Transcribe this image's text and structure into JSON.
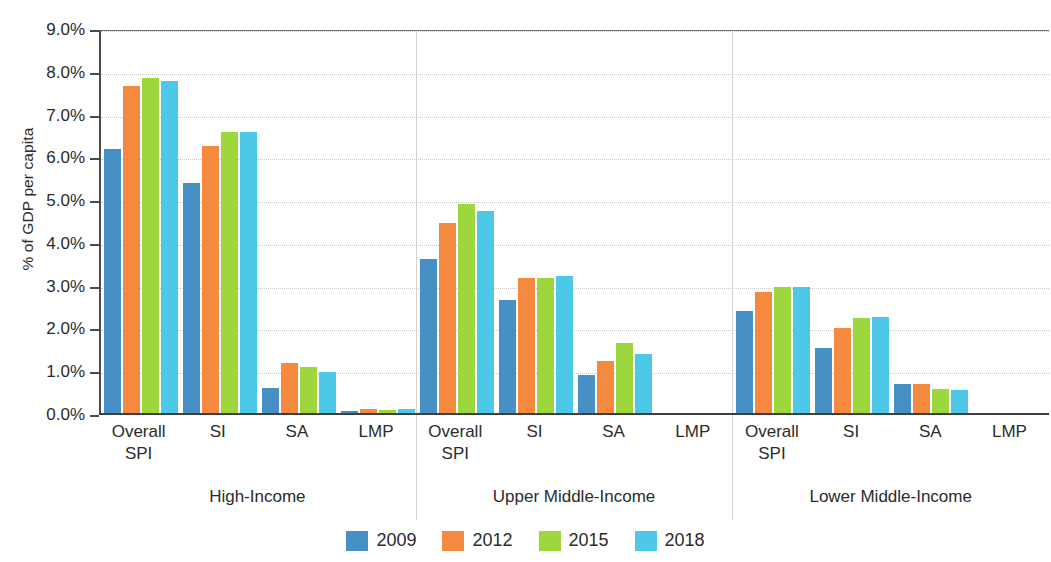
{
  "chart_data": {
    "type": "bar",
    "title": "",
    "subtitle": "",
    "xlabel": "",
    "ylabel": "% of GDP per capita",
    "ylim": [
      0,
      9
    ],
    "ytick_labels": [
      "0.0%",
      "1.0%",
      "2.0%",
      "3.0%",
      "4.0%",
      "5.0%",
      "6.0%",
      "7.0%",
      "8.0%",
      "9.0%"
    ],
    "ytick_values": [
      0,
      1,
      2,
      3,
      4,
      5,
      6,
      7,
      8,
      9
    ],
    "grid": true,
    "legend_position": "bottom",
    "categories": [
      "Overall SPI",
      "SI",
      "SA",
      "LMP"
    ],
    "groups": [
      "High-Income",
      "Upper Middle-Income",
      "Lower Middle-Income"
    ],
    "series": [
      {
        "name": "2009",
        "color": "#4690c6"
      },
      {
        "name": "2012",
        "color": "#f5893f"
      },
      {
        "name": "2015",
        "color": "#9ed63e"
      },
      {
        "name": "2018",
        "color": "#4ec8e8"
      }
    ],
    "values": {
      "High-Income": {
        "Overall SPI": [
          6.22,
          7.7,
          7.87,
          7.8
        ],
        "SI": [
          5.42,
          6.3,
          6.62,
          6.62
        ],
        "SA": [
          0.63,
          1.22,
          1.12,
          1.0
        ],
        "LMP": [
          0.1,
          0.15,
          0.12,
          0.14
        ]
      },
      "Upper Middle-Income": {
        "Overall SPI": [
          3.65,
          4.5,
          4.94,
          4.78
        ],
        "SI": [
          2.68,
          3.2,
          3.2,
          3.24
        ],
        "SA": [
          0.94,
          1.26,
          1.69,
          1.43
        ],
        "LMP": [
          0.02,
          0.02,
          0.02,
          0.05
        ]
      },
      "Lower Middle-Income": {
        "Overall SPI": [
          2.44,
          2.88,
          3.0,
          3.0
        ],
        "SI": [
          1.56,
          2.04,
          2.26,
          2.28
        ],
        "SA": [
          0.72,
          0.73,
          0.61,
          0.58
        ],
        "LMP": [
          0.04,
          0.02,
          0.02,
          0.03
        ]
      }
    }
  },
  "axis": {
    "y_title": "% of GDP per capita",
    "y_ticks": [
      {
        "label": "9.0%",
        "value": 9
      },
      {
        "label": "8.0%",
        "value": 8
      },
      {
        "label": "7.0%",
        "value": 7
      },
      {
        "label": "6.0%",
        "value": 6
      },
      {
        "label": "5.0%",
        "value": 5
      },
      {
        "label": "4.0%",
        "value": 4
      },
      {
        "label": "3.0%",
        "value": 3
      },
      {
        "label": "2.0%",
        "value": 2
      },
      {
        "label": "1.0%",
        "value": 1
      },
      {
        "label": "0.0%",
        "value": 0
      }
    ]
  },
  "x_categories": [
    {
      "line1": "Overall",
      "line2": "SPI"
    },
    {
      "line1": "SI",
      "line2": ""
    },
    {
      "line1": "SA",
      "line2": ""
    },
    {
      "line1": "LMP",
      "line2": ""
    }
  ],
  "group_labels": [
    {
      "label": "High-Income"
    },
    {
      "label": "Upper Middle-Income"
    },
    {
      "label": "Lower Middle-Income"
    }
  ],
  "legend": {
    "items": [
      {
        "label": "2009",
        "color": "#4690c6"
      },
      {
        "label": "2012",
        "color": "#f5893f"
      },
      {
        "label": "2015",
        "color": "#9ed63e"
      },
      {
        "label": "2018",
        "color": "#4ec8e8"
      }
    ]
  }
}
